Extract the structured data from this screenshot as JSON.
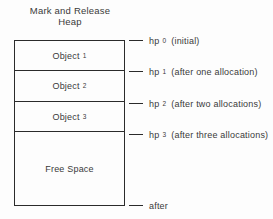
{
  "diagram": {
    "title": {
      "line1": "Mark and Release",
      "line2": "Heap"
    },
    "heap": {
      "sections": [
        {
          "name": "Object",
          "subscript": "1"
        },
        {
          "name": "Object",
          "subscript": "2"
        },
        {
          "name": "Object",
          "subscript": "3"
        },
        {
          "name": "Free Space",
          "subscript": ""
        }
      ]
    },
    "pointers": [
      {
        "name": "hp",
        "subscript": "0",
        "annotation": "(initial)"
      },
      {
        "name": "hp",
        "subscript": "1",
        "annotation": "(after one allocation)"
      },
      {
        "name": "hp",
        "subscript": "2",
        "annotation": "(after two allocations)"
      },
      {
        "name": "hp",
        "subscript": "3",
        "annotation": "(after three allocations)"
      },
      {
        "name": "after",
        "subscript": "",
        "annotation": ""
      }
    ],
    "colors": {
      "line": "#2b2b2b",
      "text": "#3a3a3a",
      "background": "#fdfdfd"
    }
  }
}
